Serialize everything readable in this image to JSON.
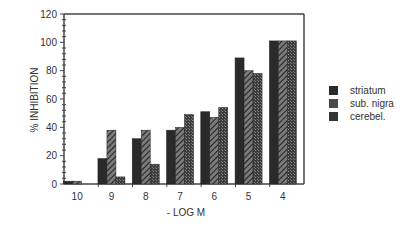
{
  "chart_data": {
    "type": "bar",
    "title": "",
    "xlabel": "- LOG M",
    "ylabel": "% INHIBITION",
    "categories": [
      "10",
      "9",
      "8",
      "7",
      "6",
      "5",
      "4"
    ],
    "series": [
      {
        "name": "striatum",
        "values": [
          2,
          18,
          32,
          38,
          51,
          89,
          101
        ],
        "color": "#2a2a2a",
        "pattern": "solid"
      },
      {
        "name": "sub. nigra",
        "values": [
          2,
          38,
          38,
          40,
          47,
          80,
          101
        ],
        "color": "#555555",
        "pattern": "hatched"
      },
      {
        "name": "cerebel.",
        "values": [
          0,
          5,
          14,
          49,
          54,
          78,
          101
        ],
        "color": "#3a3a3a",
        "pattern": "stippled"
      }
    ],
    "ylim": [
      0,
      120
    ],
    "yticks": [
      0,
      20,
      40,
      60,
      80,
      100,
      120
    ],
    "grid": false,
    "legend_position": "right"
  },
  "legend": {
    "items": [
      {
        "label": "striatum"
      },
      {
        "label": "sub. nigra"
      },
      {
        "label": "cerebel."
      }
    ]
  }
}
